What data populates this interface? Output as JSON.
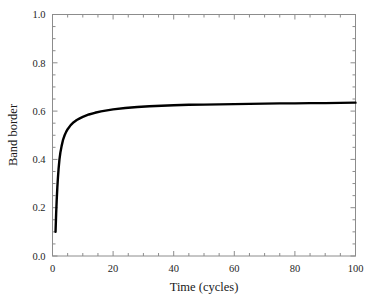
{
  "chart_data": {
    "type": "line",
    "title": "",
    "xlabel": "Time (cycles)",
    "ylabel": "Band border",
    "xlim": [
      0,
      100
    ],
    "ylim": [
      0.0,
      1.0
    ],
    "xticks": [
      0,
      20,
      40,
      60,
      80,
      100
    ],
    "xtick_labels": [
      "0",
      "20",
      "40",
      "60",
      "80",
      "100"
    ],
    "yticks": [
      0.0,
      0.2,
      0.4,
      0.6,
      0.8,
      1.0
    ],
    "ytick_labels": [
      "0.0",
      "0.2",
      "0.4",
      "0.6",
      "0.8",
      "1.0"
    ],
    "x_minor_interval": 5,
    "y_minor_interval": 0.05,
    "grid": false,
    "legend": null,
    "frame": "box",
    "tick_direction": "in",
    "line_color": "#000000",
    "line_width": 2.4,
    "series": [
      {
        "name": "Band border",
        "x": [
          1,
          1.2,
          1.4,
          1.6,
          1.8,
          2,
          2.3,
          2.6,
          3,
          3.5,
          4,
          4.5,
          5,
          6,
          7,
          8,
          9,
          10,
          12,
          14,
          16,
          18,
          20,
          24,
          28,
          32,
          36,
          40,
          45,
          50,
          55,
          60,
          65,
          70,
          75,
          80,
          85,
          90,
          95,
          100
        ],
        "y": [
          0.1,
          0.175,
          0.235,
          0.285,
          0.325,
          0.36,
          0.4,
          0.428,
          0.455,
          0.482,
          0.5,
          0.514,
          0.525,
          0.542,
          0.554,
          0.563,
          0.57,
          0.576,
          0.586,
          0.593,
          0.599,
          0.603,
          0.607,
          0.613,
          0.617,
          0.62,
          0.622,
          0.624,
          0.626,
          0.627,
          0.628,
          0.629,
          0.63,
          0.631,
          0.632,
          0.632,
          0.633,
          0.633,
          0.634,
          0.635
        ]
      }
    ]
  },
  "figure": {
    "background_color": "#ffffff",
    "axis_color": "#8c8c8c",
    "text_color": "#262626"
  }
}
